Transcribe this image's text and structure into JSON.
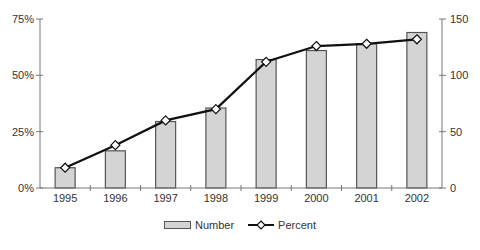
{
  "chart_data": {
    "type": "bar+line",
    "title": "",
    "xlabel": "",
    "categories": [
      "1995",
      "1996",
      "1997",
      "1998",
      "1999",
      "2000",
      "2001",
      "2002"
    ],
    "series": [
      {
        "name": "Number",
        "type": "bar",
        "axis": "right",
        "values": [
          18,
          33,
          59,
          71,
          114,
          122,
          128,
          138
        ],
        "color": "#d4d4d4"
      },
      {
        "name": "Percent",
        "type": "line",
        "axis": "left",
        "values": [
          9,
          19,
          30,
          35,
          56,
          63,
          64,
          66
        ],
        "color": "#111111",
        "marker": "diamond"
      }
    ],
    "left_axis": {
      "label": "",
      "ylim": [
        0,
        75
      ],
      "ticks": [
        "0%",
        "25%",
        "50%",
        "75%"
      ],
      "tick_values": [
        0,
        25,
        50,
        75
      ]
    },
    "right_axis": {
      "label": "",
      "ylim": [
        0,
        150
      ],
      "ticks": [
        "0",
        "50",
        "100",
        "150"
      ],
      "tick_values": [
        0,
        50,
        100,
        150
      ]
    },
    "grid": false,
    "legend_position": "bottom"
  },
  "legend": {
    "number_label": "Number",
    "percent_label": "Percent"
  }
}
